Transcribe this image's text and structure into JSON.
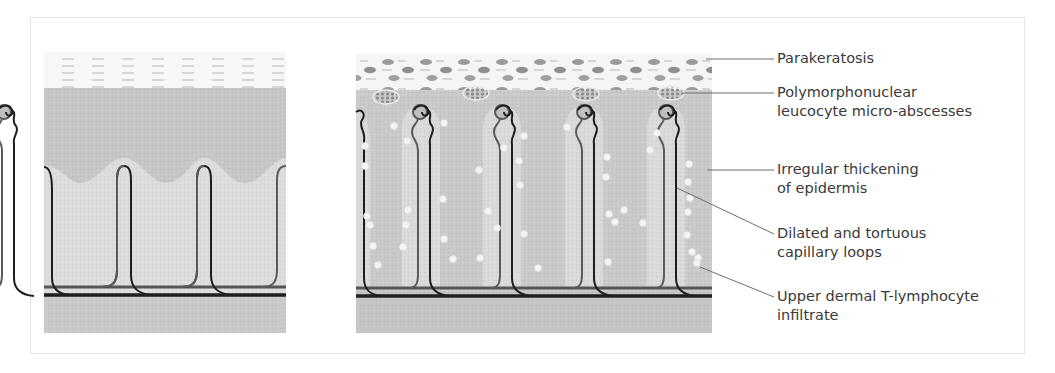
{
  "figure": {
    "left_panel": {
      "name": "Normal skin"
    },
    "right_panel": {
      "name": "Psoriatic skin"
    },
    "labels": [
      {
        "id": "parakeratosis",
        "lines": [
          "Parakeratosis"
        ]
      },
      {
        "id": "micro-abscesses",
        "lines": [
          "Polymorphonuclear",
          "leucocyte micro-abscesses"
        ]
      },
      {
        "id": "epidermis-thickening",
        "lines": [
          "Irregular thickening",
          "of epidermis"
        ]
      },
      {
        "id": "capillary-loops",
        "lines": [
          "Dilated and tortuous",
          "capillary loops"
        ]
      },
      {
        "id": "lymphocyte-infiltrate",
        "lines": [
          "Upper dermal T-lymphocyte",
          "infiltrate"
        ]
      }
    ],
    "colors": {
      "stratum_corneum_bg": "#f6f6f6",
      "epidermis": "#c9c9c9",
      "dermal_papilla": "#dedede",
      "dermis": "#d0d0d0",
      "lower_dermis": "#c4c4c4",
      "vessel_dark": "#1e1e1e",
      "vessel_mid": "#5a5a5a",
      "leader_line": "#6e6e6e",
      "text": "#3a3a3a"
    }
  }
}
